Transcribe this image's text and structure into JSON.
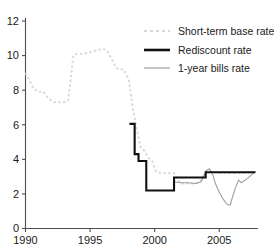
{
  "chart_data": {
    "type": "line",
    "title": "",
    "xlabel": "",
    "ylabel": "",
    "xlim": [
      1990,
      2008
    ],
    "ylim": [
      0,
      12
    ],
    "ytick_values": [
      0,
      2,
      4,
      6,
      8,
      10,
      12
    ],
    "ytick_labels": [
      "0",
      "2",
      "4",
      "6",
      "8",
      "10",
      "12"
    ],
    "xtick_values": [
      1990,
      1995,
      2000,
      2005
    ],
    "xtick_labels": [
      "1990",
      "1995",
      "2000",
      "2005"
    ],
    "grid": false,
    "legend_position": "top-right",
    "series": [
      {
        "name": "Short-term base rate",
        "style": "dotted",
        "color": "#d8d8d8",
        "points": [
          [
            1990.0,
            9.0
          ],
          [
            1990.3,
            8.6
          ],
          [
            1990.6,
            8.1
          ],
          [
            1991.0,
            7.9
          ],
          [
            1991.4,
            7.9
          ],
          [
            1991.8,
            7.5
          ],
          [
            1992.2,
            7.3
          ],
          [
            1992.6,
            7.3
          ],
          [
            1993.0,
            7.3
          ],
          [
            1993.3,
            7.4
          ],
          [
            1993.5,
            8.6
          ],
          [
            1993.7,
            10.0
          ],
          [
            1994.0,
            10.1
          ],
          [
            1994.5,
            10.1
          ],
          [
            1995.0,
            10.2
          ],
          [
            1995.5,
            10.3
          ],
          [
            1996.0,
            10.4
          ],
          [
            1996.3,
            10.3
          ],
          [
            1996.6,
            9.9
          ],
          [
            1997.0,
            9.3
          ],
          [
            1997.3,
            9.2
          ],
          [
            1997.6,
            9.2
          ],
          [
            1998.0,
            8.6
          ],
          [
            1998.3,
            7.0
          ],
          [
            1998.6,
            5.8
          ],
          [
            1998.9,
            4.7
          ],
          [
            1999.2,
            4.5
          ],
          [
            1999.5,
            4.1
          ],
          [
            1999.8,
            3.9
          ],
          [
            2000.1,
            3.3
          ],
          [
            2000.5,
            3.2
          ],
          [
            2001.0,
            3.2
          ],
          [
            2001.5,
            3.2
          ],
          [
            2002.0,
            2.6
          ],
          [
            2002.5,
            2.6
          ],
          [
            2003.0,
            2.6
          ],
          [
            2003.5,
            2.7
          ],
          [
            2004.0,
            3.3
          ],
          [
            2004.4,
            3.3
          ],
          [
            2005.0,
            3.2
          ],
          [
            2005.6,
            3.2
          ],
          [
            2006.2,
            3.2
          ],
          [
            2007.0,
            3.2
          ],
          [
            2007.8,
            3.25
          ]
        ]
      },
      {
        "name": "Rediscount rate",
        "style": "solid-step",
        "color": "#111111",
        "points": [
          [
            1998.05,
            6.05
          ],
          [
            1998.45,
            6.05
          ],
          [
            1998.45,
            4.3
          ],
          [
            1998.75,
            4.3
          ],
          [
            1998.75,
            3.9
          ],
          [
            1999.35,
            3.9
          ],
          [
            1999.35,
            2.2
          ],
          [
            2001.5,
            2.2
          ],
          [
            2001.5,
            2.95
          ],
          [
            2003.95,
            2.95
          ],
          [
            2003.95,
            3.25
          ],
          [
            2007.8,
            3.25
          ]
        ]
      },
      {
        "name": "1-year bills rate",
        "style": "solid-thin",
        "color": "#9e9e9e",
        "points": [
          [
            2001.5,
            2.7
          ],
          [
            2002.0,
            2.65
          ],
          [
            2002.6,
            2.65
          ],
          [
            2003.2,
            2.6
          ],
          [
            2003.6,
            2.7
          ],
          [
            2004.0,
            3.35
          ],
          [
            2004.25,
            3.45
          ],
          [
            2004.5,
            3.1
          ],
          [
            2004.7,
            2.6
          ],
          [
            2005.0,
            2.1
          ],
          [
            2005.3,
            1.7
          ],
          [
            2005.6,
            1.4
          ],
          [
            2005.85,
            1.35
          ],
          [
            2006.0,
            1.75
          ],
          [
            2006.25,
            2.35
          ],
          [
            2006.5,
            2.8
          ],
          [
            2006.7,
            2.65
          ],
          [
            2006.9,
            2.75
          ],
          [
            2007.2,
            2.9
          ],
          [
            2007.5,
            3.1
          ],
          [
            2007.8,
            3.3
          ]
        ]
      }
    ]
  },
  "legend": {
    "entries": [
      {
        "label": "Short-term base rate"
      },
      {
        "label": "Rediscount rate"
      },
      {
        "label": "1-year bills rate"
      }
    ]
  }
}
